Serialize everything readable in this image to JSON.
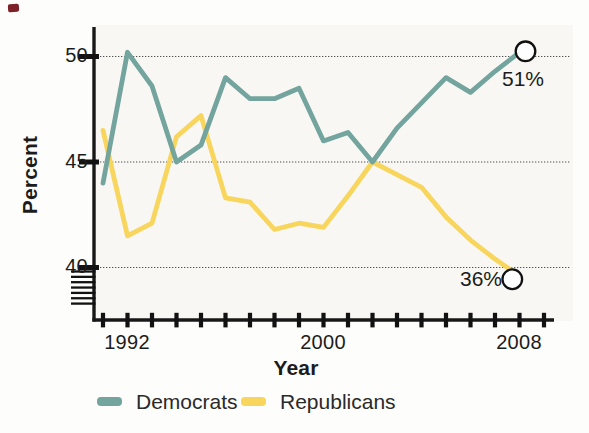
{
  "chart_data": {
    "type": "line",
    "title": "",
    "xlabel": "Year",
    "ylabel": "Percent",
    "x": [
      1991,
      1992,
      1993,
      1994,
      1995,
      1996,
      1997,
      1998,
      1999,
      2000,
      2001,
      2002,
      2003,
      2004,
      2005,
      2006,
      2007,
      2008
    ],
    "x_axis": {
      "first_tick_year": 1991,
      "last_tick_year": 2009,
      "tick_interval": 1,
      "labeled_ticks": [
        "1992",
        "2000",
        "2008"
      ]
    },
    "y_axis": {
      "ticks": [
        "50",
        "45",
        "40"
      ],
      "tick_values": [
        50,
        45,
        40
      ],
      "unit": "percent",
      "axis_break_below": 40
    },
    "grid": true,
    "legend_position": "bottom",
    "series": [
      {
        "name": "Democrats",
        "color": "#73a49d",
        "values": [
          44,
          50.2,
          48.6,
          45,
          45.8,
          49,
          48,
          48,
          48.5,
          46,
          46.4,
          45,
          46.6,
          47.8,
          49,
          48.3,
          49.3,
          51
        ],
        "end_label": "51%",
        "end_value_plotted": 50.2
      },
      {
        "name": "Republicans",
        "color": "#f8d65e",
        "values": [
          46.5,
          41.5,
          42.1,
          46.2,
          47.2,
          43.3,
          43.1,
          41.8,
          42.1,
          41.9,
          43.4,
          45,
          44.4,
          43.8,
          42.4,
          41.3,
          40.4,
          36
        ],
        "end_label": "36%",
        "end_value_plotted": 39.6
      }
    ]
  }
}
